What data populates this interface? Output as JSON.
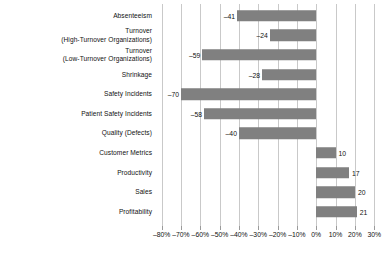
{
  "chart_data": {
    "type": "bar",
    "orientation": "horizontal",
    "title": "",
    "subtitle": "",
    "xlabel": "",
    "ylabel": "",
    "xlim": [
      -85,
      33
    ],
    "grid": true,
    "legend": false,
    "bar_color": "#808080",
    "gridline_color": "#c9c9c9",
    "text_color": "#111111",
    "xticks": [
      -80,
      -70,
      -60,
      -50,
      -40,
      -30,
      -20,
      -10,
      0,
      10,
      20,
      30
    ],
    "xtick_labels": [
      "–80%",
      "–70%",
      "–60%",
      "–50%",
      "–40%",
      "–30%",
      "–20%",
      "–10%",
      "0%",
      "10%",
      "20%",
      "30%"
    ],
    "categories": [
      "Absenteeism",
      "Turnover\n(High-Turnover Organizations)",
      "Turnover\n(Low-Turnover Organizations)",
      "Shrinkage",
      "Safety Incidents",
      "Patient Safety Incidents",
      "Quality (Defects)",
      "Customer Metrics",
      "Productivity",
      "Sales",
      "Profitability"
    ],
    "values": [
      -41,
      -24,
      -59,
      -28,
      -70,
      -58,
      -40,
      10,
      17,
      20,
      21
    ],
    "data_labels": [
      "–41",
      "–24",
      "–59",
      "–28",
      "–70",
      "–58",
      "–40",
      "10",
      "17",
      "20",
      "21"
    ]
  }
}
